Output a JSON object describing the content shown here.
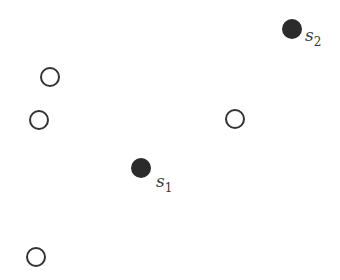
{
  "diagram": {
    "colors": {
      "stroke": "#333333",
      "fill_filled": "#2b2b2b",
      "fill_hollow": "#ffffff",
      "label": "#3a3a3a"
    },
    "filled_points": [
      {
        "id": "s1",
        "label": "s",
        "subscript": "1",
        "cx": 141,
        "cy": 168,
        "r": 10
      },
      {
        "id": "s2",
        "label": "s",
        "subscript": "2",
        "cx": 292,
        "cy": 29,
        "r": 10
      }
    ],
    "hollow_points": [
      {
        "cx": 50,
        "cy": 77,
        "r": 9
      },
      {
        "cx": 39,
        "cy": 120,
        "r": 9
      },
      {
        "cx": 235,
        "cy": 119,
        "r": 9
      },
      {
        "cx": 36,
        "cy": 257,
        "r": 9
      }
    ]
  }
}
